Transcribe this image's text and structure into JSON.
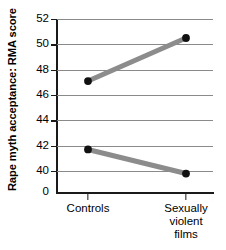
{
  "chart_data": {
    "type": "line",
    "title": "",
    "subtitle": "",
    "xlabel": "",
    "ylabel": "Rape myth acceptance: RMA score",
    "categories": [
      "Controls",
      "Sexually violent films"
    ],
    "category_labels_wrapped": [
      "Controls",
      "Sexually\nviolent films"
    ],
    "x": [
      0,
      1
    ],
    "series": [
      {
        "name": "upper",
        "values": [
          47.1,
          50.5
        ]
      },
      {
        "name": "lower",
        "values": [
          41.7,
          39.8
        ]
      }
    ],
    "ylim": [
      39.0,
      52.0
    ],
    "yticks": [
      52,
      50,
      48,
      46,
      44,
      42,
      40
    ],
    "ytick_labels": [
      "52",
      "50",
      "48",
      "46",
      "44",
      "42",
      "40"
    ],
    "axis_break_label": "0",
    "grid": true,
    "grid_axis": "y",
    "legend": "none",
    "marker": "filled-circle",
    "marker_color": "#111111",
    "line_color": "#8c8c8c",
    "grid_color": "#8a8a8a",
    "axis_color": "#1a1a1a",
    "background_color": "#ffffff"
  }
}
